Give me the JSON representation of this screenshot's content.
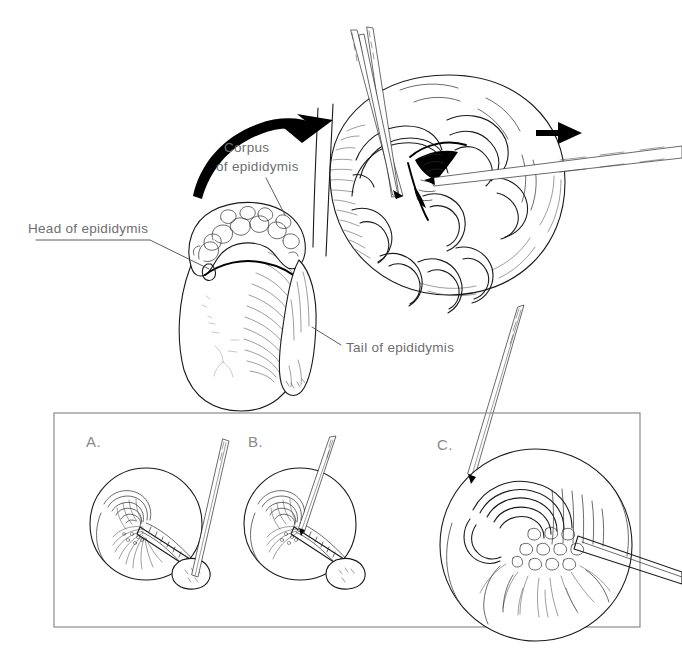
{
  "figure": {
    "background_color": "#ffffff",
    "ink_color": "#1a1a1a",
    "label_color": "#6e6e6e",
    "panel_border_color": "#8c8c8c",
    "width": 682,
    "height": 665
  },
  "labels": {
    "head_of_epididymis": "Head of epididymis",
    "corpus_of_epididymis_line1": "Corpus",
    "corpus_of_epididymis_line2": "of epididymis",
    "tail_of_epididymis": "Tail of epididymis"
  },
  "panels": {
    "a_letter": "A.",
    "b_letter": "B.",
    "c_letter": "C."
  },
  "annotations": {
    "curved_arrow_name": "rotation-arrow",
    "straight_arrow_name": "direction-arrow"
  }
}
